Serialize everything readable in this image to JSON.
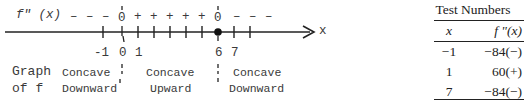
{
  "diagram": {
    "function_label": "f\" (x)",
    "axis_label": "x",
    "signs": [
      "–",
      "–",
      "–",
      "0",
      "+",
      "+",
      "+",
      "+",
      "+",
      "0",
      "–",
      "–",
      "–"
    ],
    "tick_labels": {
      "neg1": "-1",
      "zero": "0",
      "one": "1",
      "six": "6",
      "seven": "7"
    },
    "row_label": [
      "Graph",
      "of f"
    ],
    "intervals": [
      {
        "line1": "Concave",
        "line2": "Downward"
      },
      {
        "line1": "Concave",
        "line2": "Upward"
      },
      {
        "line1": "Concave",
        "line2": "Downward"
      }
    ],
    "inflection_points": [
      0,
      6
    ]
  },
  "table": {
    "title": "Test Numbers",
    "headers": [
      "x",
      "f \"(x)"
    ],
    "rows": [
      {
        "x": "−1",
        "fx": "−84(−)"
      },
      {
        "x": "1",
        "fx": "60(+)"
      },
      {
        "x": "7",
        "fx": "−84(−)"
      }
    ]
  }
}
